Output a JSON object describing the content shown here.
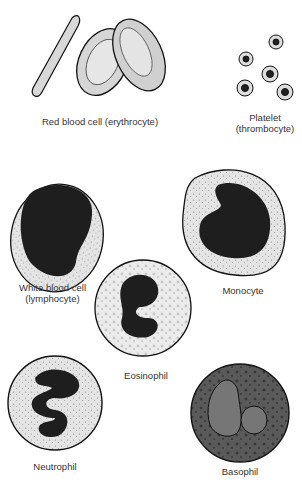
{
  "diagram": {
    "cells": [
      {
        "id": "rbc",
        "label": "Red blood cell (erythrocyte)"
      },
      {
        "id": "platelet",
        "label_line1": "Platelet",
        "label_line2": "(thrombocyte)"
      },
      {
        "id": "lymphocyte",
        "label_line1": "White blood cell",
        "label_line2": "(lymphocyte)"
      },
      {
        "id": "monocyte",
        "label": "Monocyte"
      },
      {
        "id": "eosinophil",
        "label": "Eosinophil"
      },
      {
        "id": "neutrophil",
        "label": "Neutrophil"
      },
      {
        "id": "basophil",
        "label": "Basophil"
      }
    ]
  }
}
